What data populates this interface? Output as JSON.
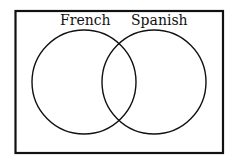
{
  "diagram": {
    "type": "venn",
    "sets": [
      {
        "label": "French"
      },
      {
        "label": "Spanish"
      }
    ],
    "colors": {
      "stroke": "#111111",
      "background": "#ffffff"
    }
  }
}
